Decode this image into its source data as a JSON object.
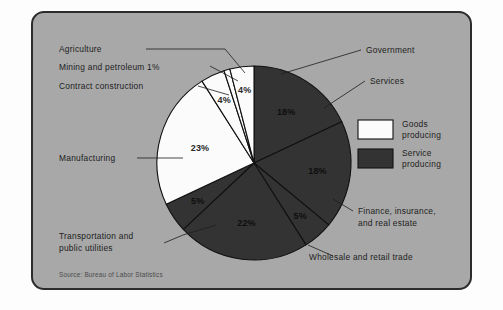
{
  "figure": {
    "source_note": "Source: Bureau of Labor Statistics",
    "card_bg": "#a8a8a8",
    "border_color": "#2c2c2c"
  },
  "legend": {
    "items": [
      {
        "label_line1": "Goods",
        "label_line2": "producing",
        "color": "#fbfbfb"
      },
      {
        "label_line1": "Service",
        "label_line2": "producing",
        "color": "#333333"
      }
    ]
  },
  "chart_data": {
    "type": "pie",
    "title": "",
    "subtitle": "",
    "xlabel": "",
    "ylabel": "",
    "grid": false,
    "legend_position": "right",
    "start_angle_deg": 0,
    "direction": "clockwise",
    "total_pct": 100,
    "colors": {
      "goods_producing": "#fbfbfb",
      "service_producing": "#333333",
      "slice_outline": "#111111"
    },
    "categories": [
      "Government",
      "Services",
      "Finance, insurance, and real estate",
      "Wholesale and retail trade",
      "Transportation and public utilities",
      "Manufacturing",
      "Contract construction",
      "Mining and petroleum",
      "Agriculture"
    ],
    "values": [
      18,
      18,
      5,
      22,
      5,
      23,
      4,
      1,
      4
    ],
    "slices": [
      {
        "name": "Government",
        "value": 18,
        "pct_label": "18%",
        "group": "service_producing",
        "fill": "#333333",
        "label": "Government",
        "label_lines": [
          "Government"
        ],
        "show_pct_in_slice": true
      },
      {
        "name": "Services",
        "value": 18,
        "pct_label": "18%",
        "group": "service_producing",
        "fill": "#333333",
        "label": "Services",
        "label_lines": [
          "Services"
        ],
        "show_pct_in_slice": true
      },
      {
        "name": "Finance, insurance, and real estate",
        "value": 5,
        "pct_label": "5%",
        "group": "service_producing",
        "fill": "#333333",
        "label": "Finance, insurance, and real estate",
        "label_lines": [
          "Finance, insurance,",
          "and real estate"
        ],
        "show_pct_in_slice": true
      },
      {
        "name": "Wholesale and retail trade",
        "value": 22,
        "pct_label": "22%",
        "group": "service_producing",
        "fill": "#333333",
        "label": "Wholesale and retail trade",
        "label_lines": [
          "Wholesale and retail trade"
        ],
        "show_pct_in_slice": true
      },
      {
        "name": "Transportation and public utilities",
        "value": 5,
        "pct_label": "5%",
        "group": "service_producing",
        "fill": "#333333",
        "label": "Transportation and public utilities",
        "label_lines": [
          "Transportation and",
          "public utilities"
        ],
        "show_pct_in_slice": true
      },
      {
        "name": "Manufacturing",
        "value": 23,
        "pct_label": "23%",
        "group": "goods_producing",
        "fill": "#fbfbfb",
        "label": "Manufacturing",
        "label_lines": [
          "Manufacturing"
        ],
        "show_pct_in_slice": true
      },
      {
        "name": "Contract construction",
        "value": 4,
        "pct_label": "4%",
        "group": "goods_producing",
        "fill": "#fbfbfb",
        "label": "Contract construction",
        "label_lines": [
          "Contract construction"
        ],
        "show_pct_in_slice": true
      },
      {
        "name": "Mining and petroleum",
        "value": 1,
        "pct_label": "1%",
        "group": "goods_producing",
        "fill": "#fbfbfb",
        "label": "Mining and petroleum 1%",
        "label_lines": [
          "Mining and petroleum 1%"
        ],
        "show_pct_in_slice": false
      },
      {
        "name": "Agriculture",
        "value": 4,
        "pct_label": "4%",
        "group": "goods_producing",
        "fill": "#fbfbfb",
        "label": "Agriculture",
        "label_lines": [
          "Agriculture"
        ],
        "show_pct_in_slice": true
      }
    ]
  },
  "callouts": {
    "agriculture": "Agriculture",
    "mining": "Mining and petroleum 1%",
    "contract_construction": "Contract construction",
    "manufacturing": "Manufacturing",
    "transportation_l1": "Transportation and",
    "transportation_l2": "public utilities",
    "government": "Government",
    "services": "Services",
    "finance_l1": "Finance, insurance,",
    "finance_l2": "and real estate",
    "wholesale": "Wholesale and retail trade"
  },
  "slice_pcts": {
    "government": "18%",
    "services": "18%",
    "finance": "5%",
    "wholesale": "22%",
    "transportation": "5%",
    "manufacturing": "23%",
    "contract_construction": "4%",
    "agriculture": "4%"
  }
}
